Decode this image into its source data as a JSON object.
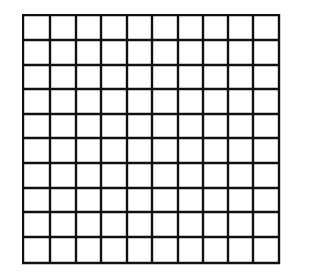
{
  "grid": {
    "rows": 10,
    "columns": 10,
    "line_color": "#111111",
    "background": "#ffffff",
    "x_lines": [
      23,
      50,
      76,
      101,
      127,
      152,
      178,
      203,
      228,
      253,
      279
    ],
    "y_lines": [
      15,
      40,
      65,
      89,
      114,
      138,
      163,
      188,
      212,
      237,
      263
    ]
  }
}
